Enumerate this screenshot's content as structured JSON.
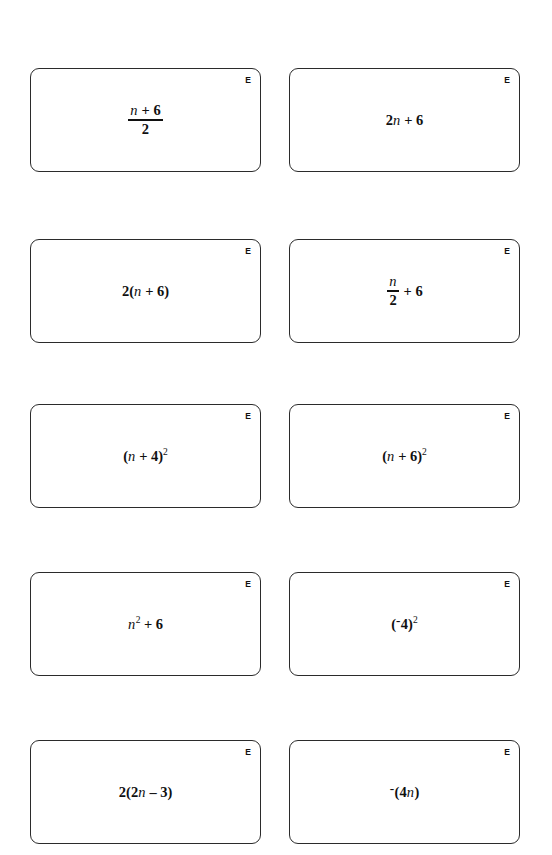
{
  "page": {
    "kind": "math-worksheet-cards",
    "background_color": "#ffffff",
    "card_border_color": "#2b2b2b",
    "text_color": "#101010",
    "columns": 2,
    "rows": 5,
    "card_count": 10
  },
  "cards": [
    {
      "id": "card-1",
      "tag": "E",
      "expression_text": "(n + 6)/2",
      "tokens": [
        {
          "type": "fraction",
          "numerator": [
            {
              "type": "var",
              "text": "n"
            },
            {
              "type": "op",
              "text": "+"
            },
            {
              "type": "num",
              "text": "6"
            }
          ],
          "denominator": [
            {
              "type": "num",
              "text": "2"
            }
          ]
        }
      ]
    },
    {
      "id": "card-2",
      "tag": "E",
      "expression_text": "2n + 6",
      "tokens": [
        {
          "type": "num",
          "text": "2"
        },
        {
          "type": "var",
          "text": "n"
        },
        {
          "type": "op",
          "text": "+"
        },
        {
          "type": "num",
          "text": "6"
        }
      ]
    },
    {
      "id": "card-3",
      "tag": "E",
      "expression_text": "2(n + 6)",
      "tokens": [
        {
          "type": "num",
          "text": "2"
        },
        {
          "type": "paren",
          "text": "("
        },
        {
          "type": "var",
          "text": "n"
        },
        {
          "type": "op",
          "text": "+"
        },
        {
          "type": "num",
          "text": "6"
        },
        {
          "type": "paren",
          "text": ")"
        }
      ]
    },
    {
      "id": "card-4",
      "tag": "E",
      "expression_text": "n/2 + 6",
      "tokens": [
        {
          "type": "fraction",
          "numerator": [
            {
              "type": "var",
              "text": "n"
            }
          ],
          "denominator": [
            {
              "type": "num",
              "text": "2"
            }
          ]
        },
        {
          "type": "op",
          "text": "+"
        },
        {
          "type": "num",
          "text": "6"
        }
      ]
    },
    {
      "id": "card-5",
      "tag": "E",
      "expression_text": "(n + 4)^2",
      "tokens": [
        {
          "type": "paren",
          "text": "("
        },
        {
          "type": "var",
          "text": "n"
        },
        {
          "type": "op",
          "text": "+"
        },
        {
          "type": "num",
          "text": "4"
        },
        {
          "type": "paren",
          "text": ")"
        },
        {
          "type": "sup",
          "text": "2"
        }
      ]
    },
    {
      "id": "card-6",
      "tag": "E",
      "expression_text": "(n + 6)^2",
      "tokens": [
        {
          "type": "paren",
          "text": "("
        },
        {
          "type": "var",
          "text": "n"
        },
        {
          "type": "op",
          "text": "+"
        },
        {
          "type": "num",
          "text": "6"
        },
        {
          "type": "paren",
          "text": ")"
        },
        {
          "type": "sup",
          "text": "2"
        }
      ]
    },
    {
      "id": "card-7",
      "tag": "E",
      "expression_text": "n^2 + 6",
      "tokens": [
        {
          "type": "var",
          "text": "n"
        },
        {
          "type": "sup",
          "text": "2"
        },
        {
          "type": "op",
          "text": "+"
        },
        {
          "type": "num",
          "text": "6"
        }
      ]
    },
    {
      "id": "card-8",
      "tag": "E",
      "expression_text": "(-4)^2",
      "tokens": [
        {
          "type": "paren",
          "text": "("
        },
        {
          "type": "negsign",
          "text": "-"
        },
        {
          "type": "num",
          "text": "4"
        },
        {
          "type": "paren",
          "text": ")"
        },
        {
          "type": "sup",
          "text": "2"
        }
      ]
    },
    {
      "id": "card-9",
      "tag": "E",
      "expression_text": "2(2n - 3)",
      "tokens": [
        {
          "type": "num",
          "text": "2"
        },
        {
          "type": "paren",
          "text": "("
        },
        {
          "type": "num",
          "text": "2"
        },
        {
          "type": "var",
          "text": "n"
        },
        {
          "type": "op",
          "text": "–"
        },
        {
          "type": "num",
          "text": "3"
        },
        {
          "type": "paren",
          "text": ")"
        }
      ]
    },
    {
      "id": "card-10",
      "tag": "E",
      "expression_text": "-(4n)",
      "tokens": [
        {
          "type": "negsign",
          "text": "-"
        },
        {
          "type": "paren",
          "text": "("
        },
        {
          "type": "num",
          "text": "4"
        },
        {
          "type": "var",
          "text": "n"
        },
        {
          "type": "paren",
          "text": ")"
        }
      ]
    }
  ]
}
